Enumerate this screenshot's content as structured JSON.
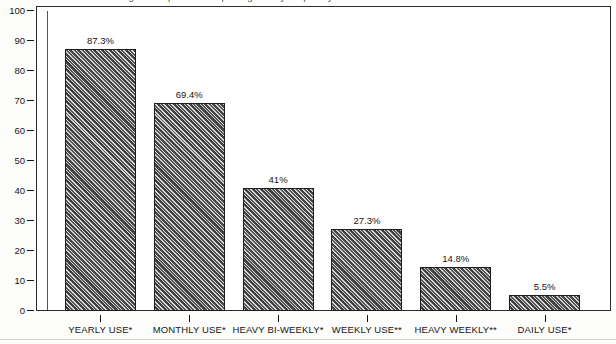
{
  "title": {
    "text": "Percentage of respondents reporting use by frequency",
    "clipped": true
  },
  "chart_data": {
    "type": "bar",
    "title": "Percentage of respondents reporting use by frequency",
    "xlabel": "",
    "ylabel": "",
    "ylim": [
      0,
      100
    ],
    "yticks": [
      0,
      10,
      20,
      30,
      40,
      50,
      60,
      70,
      80,
      90,
      100
    ],
    "ytick_labels": [
      "0",
      "10",
      "20",
      "30",
      "40",
      "50",
      "60",
      "70",
      "80",
      "90",
      "100"
    ],
    "grid": false,
    "legend": "none",
    "categories": [
      "YEARLY USE*",
      "MONTHLY USE*",
      "HEAVY BI-WEEKLY*",
      "WEEKLY USE**",
      "HEAVY WEEKLY**",
      "DAILY USE*"
    ],
    "values": [
      87.3,
      69.4,
      41,
      27.3,
      14.8,
      5.5
    ],
    "value_labels": [
      "87.3%",
      "69.4%",
      "41%",
      "27.3%",
      "14.8%",
      "5.5%"
    ],
    "bar_fill": "diagonal-hatch",
    "bar_color": "#6f6f6f",
    "axis_color": "#2b2b2b"
  }
}
